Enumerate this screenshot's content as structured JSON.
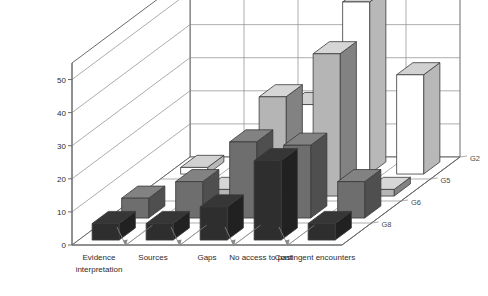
{
  "chart_data": {
    "type": "bar",
    "title": "",
    "subtitle": "",
    "xlabel": "",
    "ylabel": "",
    "zlabel": "",
    "projection": "3d",
    "grid": true,
    "legend_position": "depth-axis-right",
    "ylim": [
      0,
      55
    ],
    "yticks": [
      0,
      10,
      20,
      30,
      40,
      50
    ],
    "ytick_labels": [
      "0",
      "10",
      "20",
      "30",
      "40",
      "50"
    ],
    "categories": [
      "Evidence interpretation",
      "Sources",
      "Gaps",
      "No access to past",
      "Contingent encounters"
    ],
    "category_lines": [
      [
        "Evidence",
        "interpretation"
      ],
      [
        "Sources",
        ""
      ],
      [
        "Gaps",
        ""
      ],
      [
        "No access to past",
        ""
      ],
      [
        "Contingent encounters",
        ""
      ]
    ],
    "depth_labels": [
      "G2",
      "G5",
      "G6",
      "G8"
    ],
    "series": [
      {
        "name": "G8",
        "color": "#2e2e2e",
        "values": [
          5,
          5,
          10,
          24,
          5
        ]
      },
      {
        "name": "G6",
        "color": "#6e6e6e",
        "values": [
          6,
          11,
          23,
          22,
          11
        ]
      },
      {
        "name": "G5",
        "color": "#b5b5b5",
        "values": [
          0,
          2,
          30,
          43,
          2
        ]
      },
      {
        "name": "G2",
        "color": "#ffffff",
        "values": [
          2,
          2,
          21,
          52,
          30
        ]
      }
    ]
  },
  "colors": {
    "axis": "#6a6a6a",
    "grid": "#8a8a8a",
    "wall": "#ffffff",
    "floor": "#ffffff",
    "text": "#2b2b2b",
    "series_g8": "#2e2e2e",
    "series_g6": "#6e6e6e",
    "series_g5": "#b5b5b5",
    "series_g2": "#ffffff"
  }
}
